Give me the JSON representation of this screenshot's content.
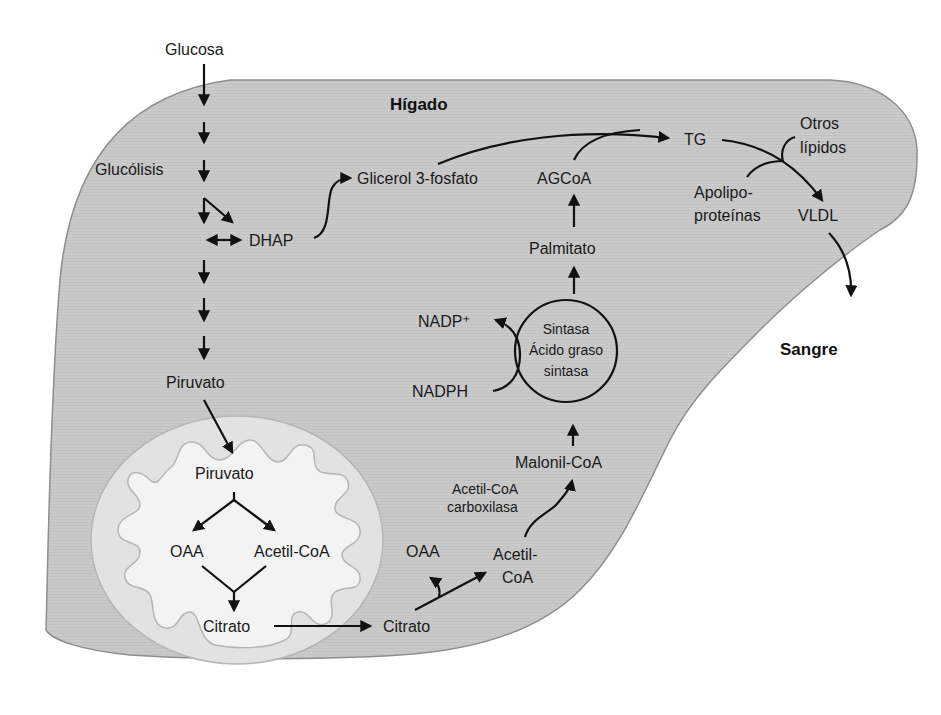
{
  "diagram": {
    "colors": {
      "liver_fill": "#c8c8c8",
      "liver_stroke": "#8e8e8e",
      "mito_outer_fill": "#e4e4e4",
      "mito_inner_fill": "#f4f4f4",
      "mito_stroke": "#b0b0b0",
      "arrow": "#111111",
      "text": "#1a1a1a"
    },
    "regions": {
      "liver": "Hígado",
      "blood": "Sangre"
    },
    "glycolysis": {
      "glucose": "Glucosa",
      "glycolysis": "Glucólisis",
      "dhap": "DHAP",
      "pyruvate": "Piruvato"
    },
    "mitochondrion": {
      "pyruvate": "Piruvato",
      "oaa": "OAA",
      "acetyl_coa": "Acetil-CoA",
      "citrate": "Citrato"
    },
    "cytosol": {
      "citrate": "Citrato",
      "oaa": "OAA",
      "acetyl_coa_line1": "Acetil-",
      "acetyl_coa_line2": "CoA",
      "enzyme_acc_line1": "Acetil-CoA",
      "enzyme_acc_line2": "carboxilasa",
      "malonyl_coa": "Malonil-CoA",
      "fas_line1": "Sintasa",
      "fas_line2": "Ácido graso",
      "fas_line3": "sintasa",
      "nadph": "NADPH",
      "nadp_plus": "NADP⁺",
      "palmitate": "Palmitato",
      "agcoa": "AGCoA",
      "glycerol3p": "Glicerol 3-fosfato",
      "tg": "TG",
      "other_lipids_line1": "Otros",
      "other_lipids_line2": "lípidos",
      "apolipo_line1": "Apolipo-",
      "apolipo_line2": "proteínas",
      "vldl": "VLDL"
    }
  }
}
